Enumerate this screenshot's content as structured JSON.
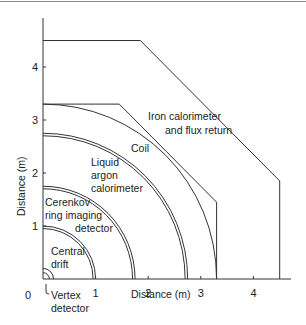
{
  "diagram": {
    "title": "",
    "xlabel": "Distance (m)",
    "ylabel": "Distance (m)",
    "x_ticks": [
      "0",
      "1",
      "2",
      "3",
      "4"
    ],
    "y_ticks": [
      "1",
      "2",
      "3",
      "4"
    ],
    "x_range_m": [
      0,
      4.5
    ],
    "y_range_m": [
      0,
      4.7
    ],
    "components": [
      {
        "id": "vertex",
        "label": [
          "Vertex",
          "detector"
        ],
        "radius_m": 0.2
      },
      {
        "id": "central-drift",
        "label": [
          "Central",
          "drift"
        ],
        "radius_m": 1.0
      },
      {
        "id": "cerenkov",
        "label": [
          "Cerenkov",
          "ring imaging",
          "detector"
        ],
        "radius_m": 1.75
      },
      {
        "id": "liquid-argon",
        "label": [
          "Liquid",
          "argon",
          "calorimeter"
        ],
        "radius_m": 2.75
      },
      {
        "id": "coil",
        "label": [
          "Coil"
        ],
        "radius_m": 3.3
      },
      {
        "id": "iron",
        "label": [
          "Iron calorimeter",
          "and flux return"
        ]
      }
    ],
    "iron_outer_m": [
      [
        0,
        4.5
      ],
      [
        1.85,
        4.5
      ],
      [
        4.5,
        1.85
      ],
      [
        4.5,
        0
      ]
    ],
    "iron_inner_m": [
      [
        0,
        3.3
      ],
      [
        1.45,
        3.3
      ],
      [
        3.3,
        1.45
      ],
      [
        3.3,
        0
      ]
    ]
  }
}
